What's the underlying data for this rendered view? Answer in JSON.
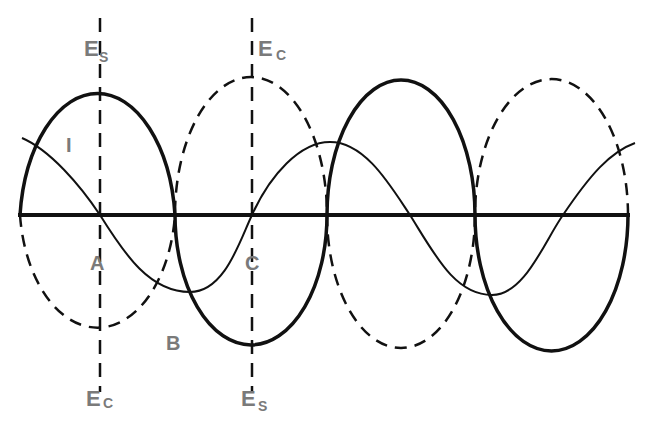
{
  "diagram": {
    "colors": {
      "ink": "#111111",
      "label": "#7a7a7a",
      "background": "#ffffff"
    },
    "labels": {
      "es_top": {
        "main": "E",
        "sub": "S"
      },
      "ec_top": {
        "main": "E",
        "sub": "C"
      },
      "current": "I",
      "point_a": "A",
      "point_b": "B",
      "point_c": "C",
      "ec_bottom": {
        "main": "E",
        "sub": "C"
      },
      "es_bottom": {
        "main": "E",
        "sub": "S"
      }
    },
    "curves": [
      {
        "name": "Es",
        "style": "solid-thick"
      },
      {
        "name": "Ec",
        "style": "dashed"
      },
      {
        "name": "I",
        "style": "solid-thin"
      }
    ]
  }
}
